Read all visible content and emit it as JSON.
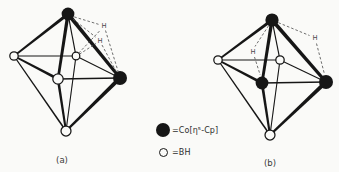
{
  "colors": {
    "ink": "#161616",
    "paper": "#fafaf8",
    "dash": "#4a4a4a",
    "text": "#3a3a3a"
  },
  "legend": {
    "items": [
      {
        "icon": "co-cp-legend-icon",
        "shape": "filled-circle",
        "label": "=Co[η⁵-Cp]"
      },
      {
        "icon": "bh-legend-icon",
        "shape": "open-circle",
        "label": "=BH"
      }
    ]
  },
  "structures": {
    "a": {
      "caption": "(a)",
      "nodes": [
        {
          "id": "top",
          "x": 68,
          "y": 14,
          "r": 6.4,
          "type": "Co"
        },
        {
          "id": "left",
          "x": 14,
          "y": 56,
          "r": 4.2,
          "type": "BH"
        },
        {
          "id": "back",
          "x": 76,
          "y": 56,
          "r": 3.8,
          "type": "BH"
        },
        {
          "id": "front",
          "x": 58,
          "y": 79,
          "r": 5.2,
          "type": "BH"
        },
        {
          "id": "right",
          "x": 120,
          "y": 78,
          "r": 7.0,
          "type": "Co"
        },
        {
          "id": "bottom",
          "x": 66,
          "y": 131,
          "r": 5.0,
          "type": "BH"
        }
      ],
      "edges": [
        {
          "from": "top",
          "to": "back",
          "w1": 1.2,
          "w2": 1.2
        },
        {
          "from": "left",
          "to": "back",
          "w1": 1.0,
          "w2": 1.0
        },
        {
          "from": "back",
          "to": "right",
          "w1": 1.1,
          "w2": 1.1
        },
        {
          "from": "back",
          "to": "bottom",
          "w1": 1.1,
          "w2": 1.1
        },
        {
          "from": "front",
          "to": "right",
          "w1": 1.4,
          "w2": 1.4
        },
        {
          "from": "left",
          "to": "bottom",
          "w1": 1.3,
          "w2": 1.6
        },
        {
          "from": "top",
          "to": "left",
          "w1": 3.4,
          "w2": 1.6
        },
        {
          "from": "top",
          "to": "front",
          "w1": 3.4,
          "w2": 2.6
        },
        {
          "from": "top",
          "to": "right",
          "w1": 3.8,
          "w2": 3.0
        },
        {
          "from": "left",
          "to": "front",
          "w1": 1.8,
          "w2": 3.0
        },
        {
          "from": "front",
          "to": "bottom",
          "w1": 2.6,
          "w2": 2.0
        },
        {
          "from": "bottom",
          "to": "right",
          "w1": 2.2,
          "w2": 4.0
        }
      ],
      "bridge_h": [
        {
          "id": "H1",
          "x": 104,
          "y": 26,
          "text": "H"
        },
        {
          "id": "H2",
          "x": 100,
          "y": 41,
          "text": "H"
        }
      ],
      "dashed": [
        {
          "x1": 74.2,
          "y1": 16.9,
          "x2": 98.5,
          "y2": 24.3
        },
        {
          "x1": 73.0,
          "y1": 19.0,
          "x2": 95.5,
          "y2": 37.0
        },
        {
          "x1": 78.7,
          "y1": 53.1,
          "x2": 100.5,
          "y2": 30.0
        },
        {
          "x1": 79.4,
          "y1": 54.2,
          "x2": 96.0,
          "y2": 43.5
        },
        {
          "x1": 105.5,
          "y1": 30.5,
          "x2": 118.0,
          "y2": 71.0
        },
        {
          "x1": 102.0,
          "y1": 45.0,
          "x2": 116.5,
          "y2": 72.0
        }
      ]
    },
    "b": {
      "caption": "(b)",
      "nodes": [
        {
          "id": "top",
          "x": 272,
          "y": 20,
          "r": 6.6,
          "type": "Co"
        },
        {
          "id": "left",
          "x": 218,
          "y": 60,
          "r": 4.2,
          "type": "BH"
        },
        {
          "id": "back",
          "x": 280,
          "y": 60,
          "r": 4.2,
          "type": "BH"
        },
        {
          "id": "front",
          "x": 262,
          "y": 83,
          "r": 6.4,
          "type": "Co"
        },
        {
          "id": "right",
          "x": 326,
          "y": 82,
          "r": 7.0,
          "type": "Co"
        },
        {
          "id": "bottom",
          "x": 270,
          "y": 135,
          "r": 5.0,
          "type": "BH"
        }
      ],
      "edges": [
        {
          "from": "top",
          "to": "back",
          "w1": 1.2,
          "w2": 1.2
        },
        {
          "from": "left",
          "to": "back",
          "w1": 1.0,
          "w2": 1.0
        },
        {
          "from": "back",
          "to": "right",
          "w1": 1.1,
          "w2": 1.1
        },
        {
          "from": "back",
          "to": "bottom",
          "w1": 1.1,
          "w2": 1.1
        },
        {
          "from": "front",
          "to": "right",
          "w1": 1.4,
          "w2": 1.4
        },
        {
          "from": "left",
          "to": "bottom",
          "w1": 1.3,
          "w2": 1.6
        },
        {
          "from": "top",
          "to": "left",
          "w1": 3.2,
          "w2": 1.6
        },
        {
          "from": "top",
          "to": "front",
          "w1": 3.4,
          "w2": 2.8
        },
        {
          "from": "top",
          "to": "right",
          "w1": 3.8,
          "w2": 3.2
        },
        {
          "from": "left",
          "to": "front",
          "w1": 1.8,
          "w2": 3.0
        },
        {
          "from": "front",
          "to": "bottom",
          "w1": 2.8,
          "w2": 2.0
        },
        {
          "from": "bottom",
          "to": "right",
          "w1": 2.2,
          "w2": 4.0
        }
      ],
      "bridge_h": [
        {
          "id": "H1",
          "x": 253,
          "y": 52,
          "text": "H"
        },
        {
          "id": "H2",
          "x": 315,
          "y": 38,
          "text": "H"
        }
      ],
      "dashed": [
        {
          "x1": 268.6,
          "y1": 25.7,
          "x2": 255.0,
          "y2": 46.5
        },
        {
          "x1": 254.5,
          "y1": 57.0,
          "x2": 260.2,
          "y2": 75.0
        },
        {
          "x1": 278.4,
          "y1": 22.7,
          "x2": 309.5,
          "y2": 35.5
        },
        {
          "x1": 316.5,
          "y1": 43.5,
          "x2": 324.3,
          "y2": 73.5
        }
      ]
    }
  }
}
